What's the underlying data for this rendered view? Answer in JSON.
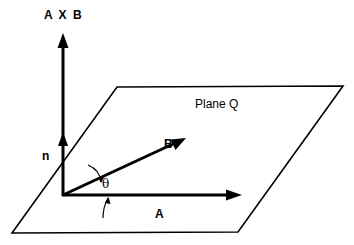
{
  "diagram": {
    "type": "vector cross product illustration",
    "labels": {
      "cross_product": "A X B",
      "plane": "Plane Q",
      "normal": "n",
      "vector_b": "B",
      "angle": "θ",
      "vector_a": "A"
    },
    "colors": {
      "stroke": "#000000",
      "background": "#ffffff"
    },
    "geometry": {
      "plane_corners": [
        [
          117,
          87
        ],
        [
          343,
          86
        ],
        [
          238,
          232
        ],
        [
          12,
          233
        ]
      ],
      "origin": [
        63,
        195
      ],
      "axb_tip": [
        63,
        33
      ],
      "normal_arrowhead_y": 140,
      "vector_a_tip": [
        242,
        195
      ],
      "vector_b_tip": [
        186,
        138
      ]
    }
  }
}
